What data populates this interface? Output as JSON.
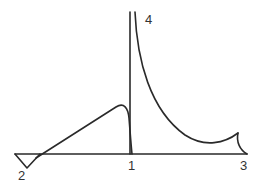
{
  "diagram": {
    "labels": {
      "point_1": "1",
      "point_2": "2",
      "point_3": "3",
      "point_4": "4"
    },
    "line_color": "#2a2a2a",
    "label_color": "#333333"
  }
}
